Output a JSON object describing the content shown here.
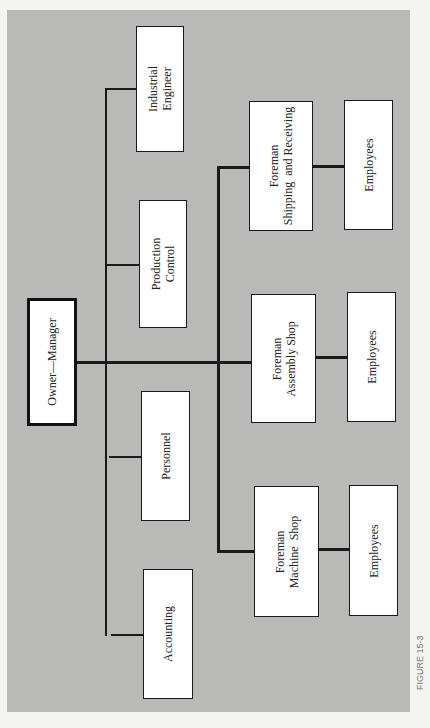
{
  "diagram": {
    "type": "org-chart",
    "orientation": "rotated-90-ccw",
    "root": {
      "label": "Owner—Manager"
    },
    "staff": [
      {
        "label": "Industrial\nEngineer"
      },
      {
        "label": "Production\nControl"
      },
      {
        "label": "Personnel"
      },
      {
        "label": "Accounting"
      }
    ],
    "line": [
      {
        "label": "Foreman\nShipping  and Receiving",
        "sub": "Employees"
      },
      {
        "label": "Foreman\nAssembly Shop",
        "sub": "Employees"
      },
      {
        "label": "Foreman\nMachine  Shop",
        "sub": "Employees"
      }
    ],
    "caption": "FIGURE 15-3"
  }
}
